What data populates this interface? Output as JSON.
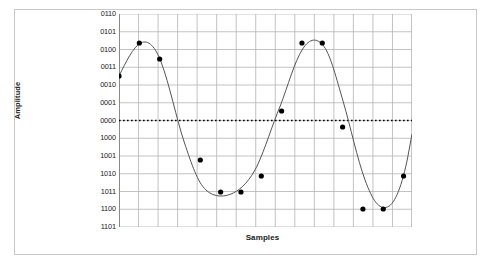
{
  "chart_data": {
    "type": "line",
    "title": "",
    "xlabel": "Samples",
    "ylabel": "Amplitude",
    "grid": true,
    "legend": null,
    "ytick_labels": [
      "0110",
      "0101",
      "0100",
      "0011",
      "0010",
      "0001",
      "0000",
      "1000",
      "1001",
      "1010",
      "1011",
      "1100",
      "1101"
    ],
    "ytick_values": [
      6,
      5,
      4,
      3,
      2,
      1,
      0,
      0,
      -1,
      -2,
      -3,
      -4,
      -5
    ],
    "ylim": [
      -5,
      6
    ],
    "xlim": [
      0,
      15
    ],
    "zero_line": {
      "label": "0000",
      "value": 0,
      "style": "dotted",
      "color": "#000000"
    },
    "x": [
      0,
      1,
      2,
      3,
      4,
      5,
      6,
      7,
      8,
      9,
      10,
      11,
      12,
      13
    ],
    "values": [
      3,
      5,
      4,
      -1,
      -3,
      -3,
      -2,
      1,
      5,
      5,
      0,
      -4,
      -4,
      -2
    ],
    "point_codes": [
      "0011",
      "0101",
      "0100",
      "1001",
      "1011",
      "1011",
      "1010",
      "0001",
      "0101",
      "0101",
      "0000",
      "1100",
      "1100",
      "1010"
    ],
    "series": [
      {
        "name": "sampled waveform",
        "values": [
          3,
          5,
          4,
          -1,
          -3,
          -3,
          -2,
          1,
          5,
          5,
          0,
          -4,
          -4,
          -2
        ],
        "marker": "filled-circle",
        "marker_color": "#000000",
        "line_color": "#555555"
      }
    ],
    "point_pixels": [
      [
        0,
        62
      ],
      [
        29,
        29
      ],
      [
        58,
        45
      ],
      [
        116,
        146
      ],
      [
        145,
        178
      ],
      [
        174,
        178
      ],
      [
        203,
        162
      ],
      [
        232,
        97
      ],
      [
        261,
        29
      ],
      [
        290,
        29
      ],
      [
        319,
        113
      ],
      [
        348,
        195
      ],
      [
        377,
        195
      ],
      [
        406,
        162
      ]
    ],
    "curve_path": "M 0 62 C 10 48, 20 33, 31 29 C 42 25, 52 33, 60 48 C 72 70, 82 105, 93 128 C 104 151, 112 168, 124 176 C 136 184, 152 183, 163 179 C 175 175, 187 166, 197 152 C 209 134, 218 112, 230 92 C 241 72, 250 48, 262 35 C 272 24, 283 23, 293 33 C 302 42, 310 64, 320 88 C 330 112, 340 145, 351 166 C 362 187, 371 196, 383 193 C 394 190, 404 171, 412 143 L 418 120",
    "grid_cols": 15,
    "grid_rows": 13,
    "grid_color": "#b4b4b4",
    "background": "#ffffff",
    "frame_color": "#c9c9c9"
  }
}
